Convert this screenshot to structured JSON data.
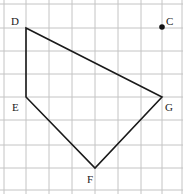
{
  "diagram": {
    "type": "grid-polygon",
    "grid": {
      "x_lines": [
        4,
        26,
        49,
        72,
        95,
        118,
        141,
        162,
        182
      ],
      "y_lines": [
        4,
        28,
        51,
        74,
        97,
        120,
        145,
        168,
        190
      ],
      "color": "#c4c4c4"
    },
    "polygon": {
      "vertices": [
        "D",
        "G",
        "F",
        "E"
      ],
      "stroke": "#1a1a1a"
    },
    "points": {
      "D": {
        "label": "D",
        "x": 26,
        "y": 28
      },
      "E": {
        "label": "E",
        "x": 26,
        "y": 97
      },
      "F": {
        "label": "F",
        "x": 95,
        "y": 168
      },
      "G": {
        "label": "G",
        "x": 162,
        "y": 97
      },
      "C": {
        "label": "C",
        "x": 162,
        "y": 27,
        "marked": true
      }
    }
  }
}
